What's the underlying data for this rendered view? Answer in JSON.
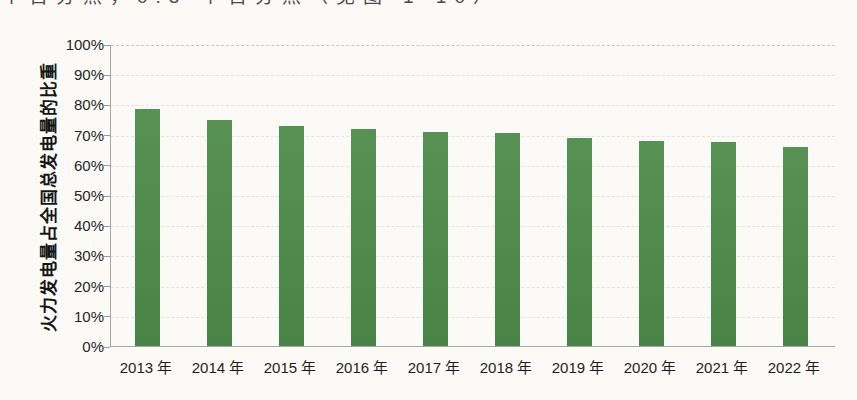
{
  "page": {
    "background_color": "#fbfaf7",
    "top_clipped_text": "个百分点，0.5 个百分点（见图 1-10）"
  },
  "chart_data": {
    "type": "bar",
    "title": "",
    "categories": [
      "2013 年",
      "2014 年",
      "2015 年",
      "2016 年",
      "2017 年",
      "2018 年",
      "2019 年",
      "2020 年",
      "2021 年",
      "2022 年"
    ],
    "values": [
      78.5,
      75.0,
      73.0,
      71.8,
      71.0,
      70.5,
      68.9,
      67.9,
      67.5,
      66.0
    ],
    "xlabel": "",
    "ylabel": "火力发电量占全国总发电量的比重",
    "ylim": [
      0,
      100
    ],
    "ytick_step": 10,
    "ytick_labels": [
      "0%",
      "10%",
      "20%",
      "30%",
      "40%",
      "50%",
      "60%",
      "70%",
      "80%",
      "90%",
      "100%"
    ],
    "grid": "horizontal-dashed-faint",
    "legend": "none",
    "bar_color": "#4e8b4a",
    "axis_color": "#a6a6a6",
    "tick_label_color": "#262626",
    "gridline_color": "#c3c3c3"
  }
}
